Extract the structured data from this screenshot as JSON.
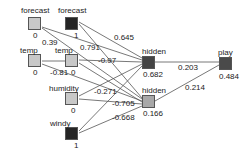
{
  "network": {
    "nodes": [
      {
        "id": "in_forecast_a",
        "label": "forecast",
        "value": "0",
        "color": "#c8c8c8",
        "x": 28,
        "y": 17
      },
      {
        "id": "in_forecast_b",
        "label": "forecast",
        "value": "1",
        "color": "#252525",
        "x": 65,
        "y": 17
      },
      {
        "id": "in_temp_a",
        "label": "temp",
        "value": "0",
        "color": "#c8c8c8",
        "x": 28,
        "y": 54
      },
      {
        "id": "in_temp_b",
        "label": "temp",
        "value": "0",
        "color": "#c8c8c8",
        "x": 65,
        "y": 54
      },
      {
        "id": "in_humidity",
        "label": "humidity",
        "value": "0",
        "color": "#c8c8c8",
        "x": 65,
        "y": 92
      },
      {
        "id": "in_windy",
        "label": "windy",
        "value": "1",
        "color": "#252525",
        "x": 65,
        "y": 127
      },
      {
        "id": "hidden_1",
        "label": "hidden",
        "value": "0.682",
        "color": "#444444",
        "x": 142,
        "y": 56
      },
      {
        "id": "hidden_2",
        "label": "hidden",
        "value": "0.166",
        "color": "#a8a8a8",
        "x": 142,
        "y": 95
      },
      {
        "id": "out_play",
        "label": "play",
        "value": "0.484",
        "color": "#4a4a4a",
        "x": 219,
        "y": 57
      }
    ],
    "edge_labels": [
      {
        "text": "0.39",
        "x": 42,
        "y": 38
      },
      {
        "text": "0.645",
        "x": 111,
        "y": 34
      },
      {
        "text": "0.791",
        "x": 79,
        "y": 43
      },
      {
        "text": "-0.97",
        "x": 97,
        "y": 56
      },
      {
        "text": "-0.81",
        "x": 48,
        "y": 68
      },
      {
        "text": "0",
        "x": 67,
        "y": 68
      },
      {
        "text": "-0.271",
        "x": 93,
        "y": 87
      },
      {
        "text": "-0.705",
        "x": 111,
        "y": 99
      },
      {
        "text": "-0.668",
        "x": 111,
        "y": 113
      },
      {
        "text": "0.203",
        "x": 178,
        "y": 62
      },
      {
        "text": "0.214",
        "x": 185,
        "y": 82
      }
    ]
  }
}
